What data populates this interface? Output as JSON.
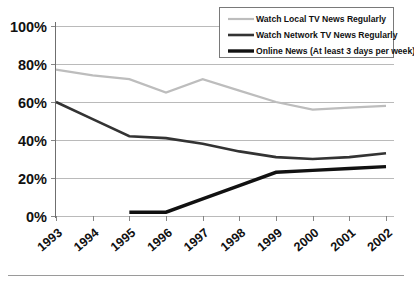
{
  "chart_data": {
    "type": "line",
    "title": "",
    "subtitle": "",
    "xlabel": "",
    "ylabel": "",
    "categories": [
      "1993",
      "1994",
      "1995",
      "1996",
      "1997",
      "1998",
      "1999",
      "2000",
      "2001",
      "2002"
    ],
    "ylim": [
      0,
      100
    ],
    "yticks": [
      0,
      20,
      40,
      60,
      80,
      100
    ],
    "ytick_labels": [
      "0%",
      "20%",
      "40%",
      "60%",
      "80%",
      "100%"
    ],
    "grid": true,
    "legend_position": "top-right",
    "series": [
      {
        "name": "Watch Local TV News Regularly",
        "color": "#bdbdbd",
        "width": 2.2,
        "values": [
          77,
          74,
          72,
          65,
          72,
          66,
          60,
          56,
          57,
          58
        ]
      },
      {
        "name": "Watch Network TV News Regularly",
        "color": "#333333",
        "width": 2.6,
        "values": [
          60,
          51,
          42,
          41,
          38,
          34,
          31,
          30,
          31,
          33
        ]
      },
      {
        "name": "Online News (At least 3 days per week)",
        "color": "#111111",
        "width": 3.4,
        "values": [
          null,
          null,
          2,
          2,
          9,
          16,
          23,
          24,
          25,
          26
        ]
      }
    ]
  },
  "legend": {
    "entries": [
      {
        "label": "Watch Local TV News Regularly"
      },
      {
        "label": "Watch Network TV News Regularly"
      },
      {
        "label": "Online News (At least 3 days per week)"
      }
    ]
  },
  "axes": {
    "y_labels": [
      "100%",
      "80%",
      "60%",
      "40%",
      "20%",
      "0%"
    ],
    "x_labels": [
      "1993",
      "1994",
      "1995",
      "1996",
      "1997",
      "1998",
      "1999",
      "2000",
      "2001",
      "2002"
    ]
  }
}
